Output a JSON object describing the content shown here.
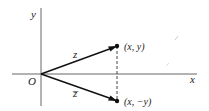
{
  "diagram": {
    "axes": {
      "x_label": "x",
      "y_label": "y",
      "origin_label": "O"
    },
    "vectors": [
      {
        "name": "z",
        "label": "z",
        "endpoint_label": "(x, y)"
      },
      {
        "name": "z-conjugate",
        "label": "z̅",
        "endpoint_label": "(x, −y)"
      }
    ],
    "colors": {
      "axis": "#555555",
      "vector": "#111111",
      "text": "#222222",
      "dashed": "#444444"
    }
  }
}
